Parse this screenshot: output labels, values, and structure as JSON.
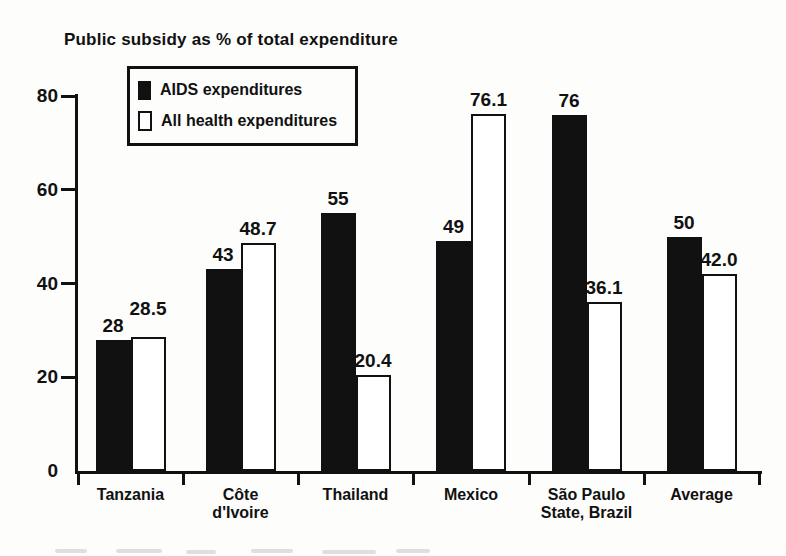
{
  "title": "Public subsidy as % of total expenditure",
  "legend": {
    "items": [
      {
        "label": "AIDS expenditures",
        "swatch": "black"
      },
      {
        "label": "All health expenditures",
        "swatch": "white"
      }
    ]
  },
  "chart_data": {
    "type": "bar",
    "title": "Public subsidy as % of total expenditure",
    "categories": [
      "Tanzania",
      "Côte\nd'Ivoire",
      "Thailand",
      "Mexico",
      "São Paulo\nState, Brazil",
      "Average"
    ],
    "series": [
      {
        "name": "AIDS expenditures",
        "style": "filled",
        "color": "#111111",
        "values": [
          28,
          43,
          55,
          49,
          76,
          50
        ],
        "value_labels": [
          "28",
          "43",
          "55",
          "49",
          "76",
          "50"
        ]
      },
      {
        "name": "All health expenditures",
        "style": "outline",
        "color": "#ffffff",
        "values": [
          28.5,
          48.7,
          20.4,
          76.1,
          36.1,
          42.0
        ],
        "value_labels": [
          "28.5",
          "48.7",
          "20.4",
          "76.1",
          "36.1",
          "42.0"
        ]
      }
    ],
    "xlabel": "",
    "ylabel": "Public subsidy as % of total expenditure",
    "ylim": [
      0,
      80
    ],
    "yticks": [
      0,
      20,
      40,
      60,
      80
    ],
    "grid": false,
    "legend_position": "top-left-inside",
    "value_labels_shown": true
  },
  "colors": {
    "bar_filled": "#111111",
    "bar_outline_fill": "#ffffff",
    "axis": "#111111",
    "background": "#fdfdfc"
  }
}
